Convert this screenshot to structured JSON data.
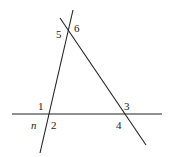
{
  "diagram": {
    "type": "geometry-angles",
    "lines": [
      {
        "id": "n",
        "name": "line n",
        "x1": 73,
        "y1": 10,
        "x2": 40,
        "y2": 153
      },
      {
        "id": "transversal",
        "name": "slanted line",
        "x1": 60,
        "y1": 18,
        "x2": 146,
        "y2": 145
      },
      {
        "id": "horizontal",
        "name": "horizontal line",
        "x1": 12,
        "y1": 114,
        "x2": 162,
        "y2": 114
      }
    ],
    "angle_labels": [
      {
        "text": "1",
        "x": 38,
        "y": 110
      },
      {
        "text": "2",
        "x": 51,
        "y": 129
      },
      {
        "text": "3",
        "x": 124,
        "y": 110
      },
      {
        "text": "4",
        "x": 116,
        "y": 129
      },
      {
        "text": "5",
        "x": 56,
        "y": 38
      },
      {
        "text": "6",
        "x": 74,
        "y": 32
      }
    ],
    "line_label": {
      "text": "n",
      "x": 31,
      "y": 129
    }
  }
}
